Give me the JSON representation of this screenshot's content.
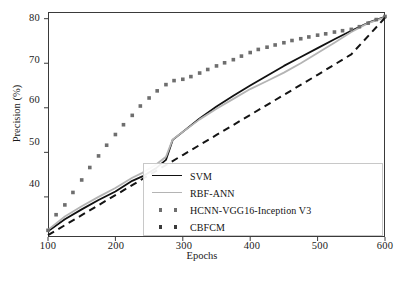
{
  "chart_data": {
    "type": "line",
    "title": "",
    "xlabel": "Epochs",
    "ylabel": "Precision (%)",
    "xlim": [
      100,
      600
    ],
    "ylim": [
      31,
      81.5
    ],
    "xticks": [
      100,
      200,
      300,
      400,
      500,
      600
    ],
    "yticks": [
      40,
      50,
      60,
      70,
      80
    ],
    "grid": false,
    "legend_position": "lower right",
    "series": [
      {
        "name": "SVM",
        "style": "solid",
        "color": "#111111",
        "x": [
          100,
          125,
          150,
          175,
          200,
          225,
          240,
          260,
          275,
          285,
          300,
          325,
          350,
          375,
          400,
          425,
          450,
          475,
          500,
          525,
          550,
          575,
          600
        ],
        "y": [
          32.3,
          35.0,
          37.2,
          39.3,
          41.2,
          43.6,
          44.6,
          46.4,
          48.3,
          52.8,
          54.6,
          57.6,
          60.3,
          62.7,
          65.0,
          67.2,
          69.4,
          71.4,
          73.4,
          75.4,
          77.3,
          79.1,
          80.4
        ]
      },
      {
        "name": "RBF-ANN",
        "style": "solid",
        "color": "#b4b4b4",
        "x": [
          100,
          125,
          150,
          175,
          200,
          225,
          240,
          260,
          275,
          285,
          300,
          325,
          350,
          375,
          400,
          425,
          450,
          475,
          500,
          525,
          550,
          575,
          600
        ],
        "y": [
          32.6,
          35.6,
          37.9,
          40.0,
          42.0,
          44.3,
          45.4,
          47.2,
          49.0,
          52.9,
          54.6,
          57.4,
          59.8,
          62.0,
          64.2,
          66.0,
          67.9,
          70.0,
          72.3,
          74.6,
          77.0,
          79.0,
          80.3
        ]
      },
      {
        "name": "HCNN-VGG16-Inception V3",
        "style": "dotted",
        "color": "#6e6e6e",
        "x": [
          100,
          112,
          125,
          137,
          150,
          162,
          175,
          187,
          200,
          212,
          225,
          237,
          250,
          262,
          275,
          287,
          300,
          312,
          325,
          337,
          350,
          362,
          375,
          387,
          400,
          412,
          425,
          437,
          450,
          462,
          475,
          487,
          500,
          512,
          525,
          537,
          550,
          562,
          575,
          587,
          600
        ],
        "y": [
          32.5,
          36.0,
          38.2,
          41.0,
          43.8,
          46.6,
          49.2,
          51.6,
          54.0,
          56.2,
          58.3,
          60.4,
          62.2,
          63.8,
          65.2,
          66.1,
          66.4,
          67.0,
          67.8,
          68.6,
          69.4,
          70.1,
          70.8,
          71.6,
          72.4,
          73.1,
          73.6,
          74.1,
          74.6,
          75.1,
          75.5,
          75.9,
          76.3,
          76.6,
          77.0,
          77.3,
          77.6,
          78.2,
          79.0,
          79.8,
          80.5
        ]
      },
      {
        "name": "CBFCM",
        "style": "dashed",
        "color": "#141414",
        "x": [
          100,
          150,
          200,
          250,
          300,
          350,
          400,
          450,
          500,
          550,
          600
        ],
        "y": [
          31.4,
          35.9,
          40.4,
          44.9,
          49.4,
          53.9,
          58.4,
          62.9,
          67.4,
          72.0,
          80.2
        ]
      }
    ]
  },
  "axes": {
    "yticks": [
      {
        "value": 80,
        "label": "80"
      },
      {
        "value": 70,
        "label": "70"
      },
      {
        "value": 60,
        "label": "60"
      },
      {
        "value": 50,
        "label": "50"
      },
      {
        "value": 40,
        "label": "40"
      }
    ],
    "xticks": [
      {
        "value": 100,
        "label": "100"
      },
      {
        "value": 200,
        "label": "200"
      },
      {
        "value": 300,
        "label": "300"
      },
      {
        "value": 400,
        "label": "400"
      },
      {
        "value": 500,
        "label": "500"
      },
      {
        "value": 600,
        "label": "600"
      }
    ],
    "ylabel": "Precision (%)",
    "xlabel": "Epochs"
  },
  "legend": {
    "items": [
      {
        "label": "SVM",
        "marker": "solid-line",
        "color": "#111111"
      },
      {
        "label": "RBF-ANN",
        "marker": "solid-line",
        "color": "#b4b4b4"
      },
      {
        "label": "HCNN-VGG16-Inception V3",
        "marker": "square-dots",
        "color": "#6e6e6e"
      },
      {
        "label": "CBFCM",
        "marker": "square-dots",
        "color": "#3a3a3a"
      }
    ]
  },
  "caption": {
    "text": "……………………………………………"
  }
}
